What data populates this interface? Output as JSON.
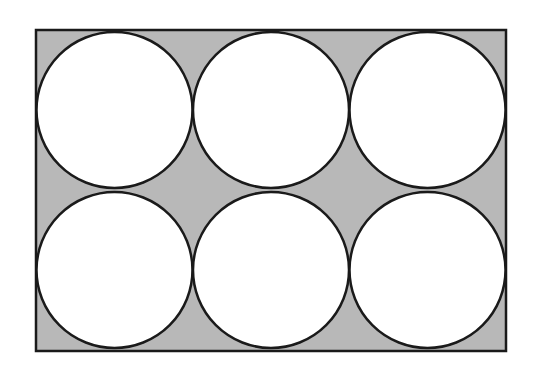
{
  "diagram": {
    "rect": {
      "x": 36,
      "y": 30,
      "width": 470,
      "height": 321,
      "fill": "#b8b8b8",
      "stroke": "#1a1a1a"
    },
    "circle_fill": "#ffffff",
    "circle_stroke": "#1a1a1a",
    "rows": 2,
    "cols": 3,
    "circles": [
      {
        "cx": 114.5,
        "cy": 110,
        "r": 78
      },
      {
        "cx": 271,
        "cy": 110,
        "r": 78
      },
      {
        "cx": 427.5,
        "cy": 110,
        "r": 78
      },
      {
        "cx": 114.5,
        "cy": 270,
        "r": 78
      },
      {
        "cx": 271,
        "cy": 270,
        "r": 78
      },
      {
        "cx": 427.5,
        "cy": 270,
        "r": 78
      }
    ]
  }
}
